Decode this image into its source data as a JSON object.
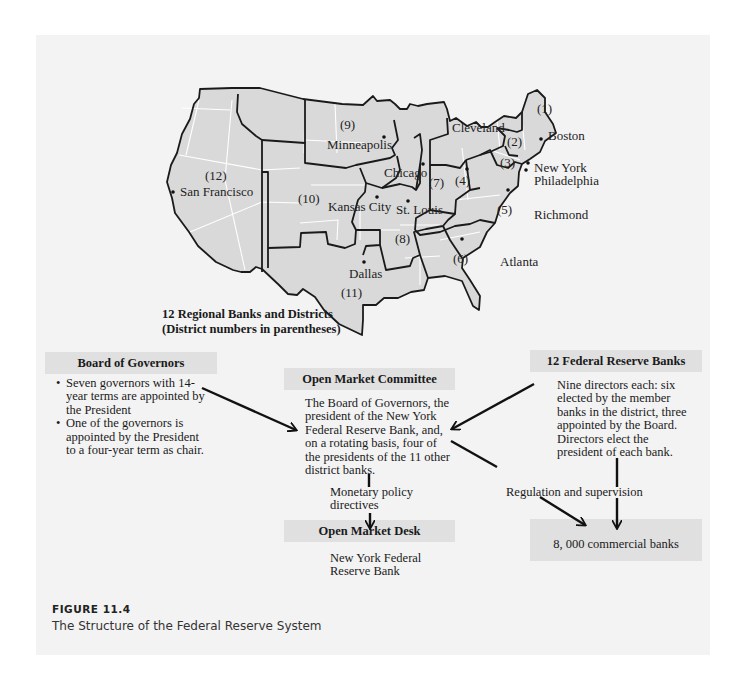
{
  "map": {
    "caption_line1": "12 Regional Banks and Districts",
    "caption_line2": "(District numbers in parentheses)",
    "cities": [
      {
        "name": "Boston",
        "x": 552,
        "y": 138
      },
      {
        "name": "New York",
        "x": 534,
        "y": 172
      },
      {
        "name": "Philadelphia",
        "x": 534,
        "y": 184
      },
      {
        "name": "Cleveland",
        "x": 452,
        "y": 132
      },
      {
        "name": "Richmond",
        "x": 534,
        "y": 218
      },
      {
        "name": "Atlanta",
        "x": 500,
        "y": 265
      },
      {
        "name": "Chicago",
        "x": 384,
        "y": 177
      },
      {
        "name": "St. Louis",
        "x": 396,
        "y": 214
      },
      {
        "name": "Minneapolis",
        "x": 327,
        "y": 148
      },
      {
        "name": "Kansas City",
        "x": 328,
        "y": 210
      },
      {
        "name": "Dallas",
        "x": 349,
        "y": 275
      },
      {
        "name": "San Francisco",
        "x": 180,
        "y": 195
      }
    ],
    "districts": [
      {
        "label": "(1)",
        "x": 537,
        "y": 113
      },
      {
        "label": "(2)",
        "x": 507,
        "y": 145
      },
      {
        "label": "(3)",
        "x": 500,
        "y": 166
      },
      {
        "label": "(4)",
        "x": 455,
        "y": 184
      },
      {
        "label": "(5)",
        "x": 497,
        "y": 213
      },
      {
        "label": "(6)",
        "x": 453,
        "y": 262
      },
      {
        "label": "(7)",
        "x": 430,
        "y": 186
      },
      {
        "label": "(8)",
        "x": 394,
        "y": 242
      },
      {
        "label": "(9)",
        "x": 340,
        "y": 129
      },
      {
        "label": "(10)",
        "x": 298,
        "y": 202
      },
      {
        "label": "(11)",
        "x": 343,
        "y": 296
      },
      {
        "label": "(12)",
        "x": 205,
        "y": 180
      }
    ]
  },
  "board_of_governors": {
    "title": "Board of Governors",
    "bullets": [
      "Seven governors with 14-year terms are appointed by the President",
      "One of the governors is appointed by the President to a four-year term as chair."
    ]
  },
  "open_market_committee": {
    "title": "Open Market Committee",
    "body": "The Board of Governors, the president of the New York Federal Reserve Bank, and, on a rotating basis, four of the presidents of the 11 other district banks."
  },
  "federal_reserve_banks": {
    "title": "12 Federal Reserve Banks",
    "body": "Nine directors each:  six elected by the member banks in the district, three appointed by the Board.  Directors elect the president of each bank."
  },
  "monetary_policy_label": "Monetary policy directives",
  "open_market_desk": {
    "title": "Open Market Desk",
    "body": "New York Federal Reserve Bank"
  },
  "regulation_label": "Regulation and supervision",
  "commercial_banks": {
    "label": "8, 000 commercial banks"
  },
  "figure": {
    "number": "FIGURE 11.4",
    "title": "The Structure of the Federal Reserve System"
  }
}
